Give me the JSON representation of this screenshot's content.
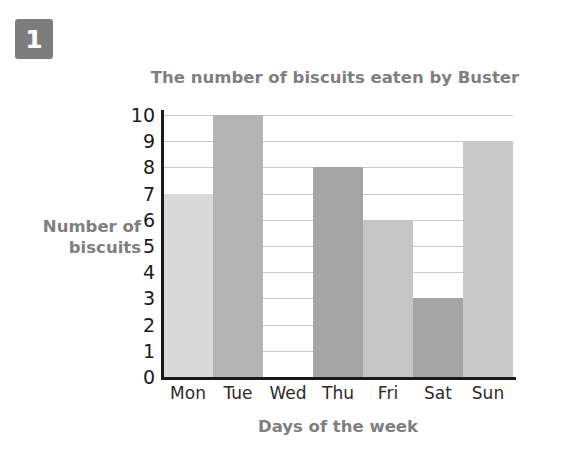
{
  "badge": {
    "label": "1"
  },
  "chart_data": {
    "type": "bar",
    "title": "The number of biscuits eaten by Buster",
    "xlabel": "Days of the week",
    "ylabel": "Number of\nbiscuits",
    "ylabel_line1": "Number of",
    "ylabel_line2": "biscuits",
    "categories": [
      "Mon",
      "Tue",
      "Wed",
      "Thu",
      "Fri",
      "Sat",
      "Sun"
    ],
    "values": [
      7,
      10,
      0,
      8,
      6,
      3,
      9
    ],
    "bar_colors": [
      "#d9d9d9",
      "#b4b4b4",
      "#ffffff",
      "#a5a5a5",
      "#c6c6c6",
      "#a5a5a5",
      "#c9c9c9"
    ],
    "ylim": [
      0,
      10
    ],
    "ytick_labels": [
      "10",
      "9",
      "8",
      "7",
      "6",
      "5",
      "4",
      "3",
      "2",
      "1",
      "0"
    ],
    "ytick_values": [
      10,
      9,
      8,
      7,
      6,
      5,
      4,
      3,
      2,
      1,
      0
    ],
    "grid": true,
    "grid_axis": "y",
    "legend": "none",
    "axis_color": "#1a1a1a",
    "grid_color": "#c9c9c9",
    "title_color": "#7f7f7f"
  }
}
